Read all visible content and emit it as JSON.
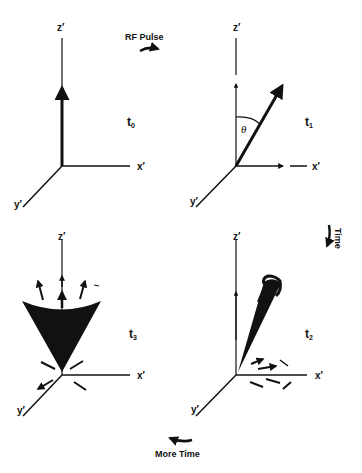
{
  "figure": {
    "transitions": {
      "rf_pulse": "RF Pulse",
      "time": "Time",
      "more_time": "More Time"
    },
    "angle_symbol": "θ",
    "panels": [
      {
        "id": "t0",
        "time_label": "t",
        "time_sub": "0",
        "axes": {
          "z": "z′",
          "x": "x′",
          "y": "y′"
        },
        "description": "Net magnetization along z′"
      },
      {
        "id": "t1",
        "time_label": "t",
        "time_sub": "1",
        "axes": {
          "z": "z′",
          "x": "x′",
          "y": "y′"
        },
        "description": "Magnetization tipped by angle θ"
      },
      {
        "id": "t2",
        "time_label": "t",
        "time_sub": "2",
        "axes": {
          "z": "z′",
          "x": "x′",
          "y": "y′"
        },
        "description": "Dephasing spins fan out"
      },
      {
        "id": "t3",
        "time_label": "t",
        "time_sub": "3",
        "axes": {
          "z": "z′",
          "x": "x′",
          "y": "y′"
        },
        "description": "Spins fully dephased in cone, regrowth along z′"
      }
    ]
  }
}
